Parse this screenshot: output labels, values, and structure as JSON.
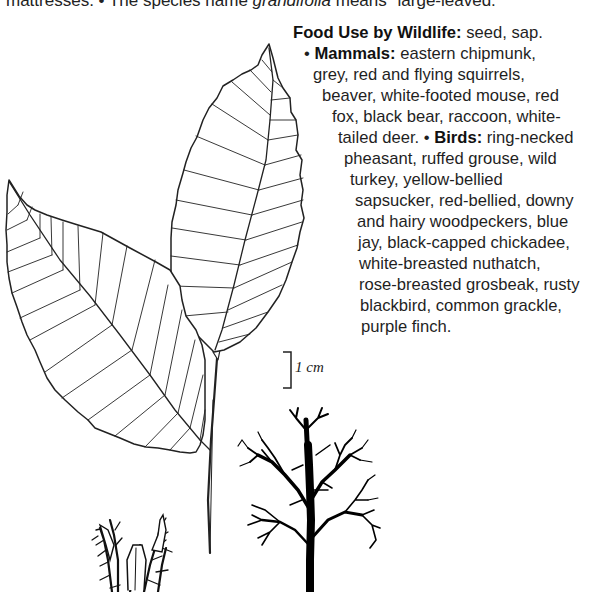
{
  "top_text": {
    "prefix": "mattresses. • The species name ",
    "italic": "grandifolia",
    "suffix": " means \"large-leaved.\""
  },
  "wildlife": {
    "heading": "Food Use by Wildlife:",
    "heading_value": " seed, sap.",
    "mammals_label": "Mammals:",
    "birds_label": "Birds:",
    "lines": [
      " eastern chipmunk,",
      "grey, red and flying squirrels,",
      "beaver, white-footed mouse, red",
      "fox, black bear, raccoon, white-",
      "tailed deer. ",
      " ring-necked",
      "pheasant, ruffed grouse, wild",
      "turkey, yellow-bellied",
      "sapsucker, red-bellied, downy",
      "and hairy woodpeckers, blue",
      "jay, black-capped chickadee,",
      "white-breasted nuthatch,",
      "rose-breasted grosbeak, rusty",
      "blackbird, common grackle,",
      "purple finch."
    ],
    "bullet": "•"
  },
  "scale_bar": {
    "label": "1 cm"
  },
  "illustrations": {
    "leaf_branch": "beech-leaf-branch-illustration",
    "burr": "beech-nut-burr-illustration",
    "tree": "beech-tree-silhouette-illustration"
  }
}
